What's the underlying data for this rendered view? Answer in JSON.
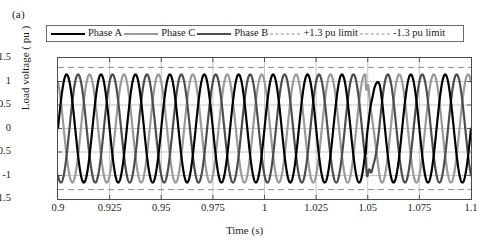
{
  "figure": {
    "panel_label": "(a)"
  },
  "legend": {
    "position": "top",
    "items": [
      {
        "label": "Phase A",
        "style": "solid",
        "color": "#000000",
        "width": 2.2,
        "swatch": "line-swatch-solid"
      },
      {
        "label": "Phase C",
        "style": "solid",
        "color": "#9a9a9a",
        "width": 2.2,
        "swatch": "line-swatch-solid"
      },
      {
        "label": "Phase B",
        "style": "solid",
        "color": "#4d4d4d",
        "width": 2.2,
        "swatch": "line-swatch-solid"
      },
      {
        "label": "+1.3 pu limit",
        "style": "dashed",
        "color": "#8e8e8e",
        "width": 1,
        "swatch": "line-swatch-dashed"
      },
      {
        "label": "-1.3 pu limit",
        "style": "dashed",
        "color": "#8e8e8e",
        "width": 1,
        "swatch": "line-swatch-dashed"
      }
    ]
  },
  "axes": {
    "ylabel": "Load voltage ( pu )",
    "xlabel": "Time (s)",
    "yticks": [
      "1.5",
      "1",
      "0.5",
      "0",
      "-0.5",
      "-1",
      "-1.5"
    ],
    "ytick_values": [
      1.5,
      1.0,
      0.5,
      0.0,
      -0.5,
      -1.0,
      -1.5
    ],
    "xticks": [
      "0.9",
      "0.925",
      "0.95",
      "0.975",
      "1",
      "1.025",
      "1.05",
      "1.075",
      "1.1"
    ],
    "xtick_values": [
      0.9,
      0.925,
      0.95,
      0.975,
      1.0,
      1.025,
      1.05,
      1.075,
      1.1
    ]
  },
  "chart_data": {
    "type": "line",
    "title": "",
    "subtitle": "",
    "xlabel": "Time (s)",
    "ylabel": "Load voltage ( pu )",
    "xlim": [
      0.9,
      1.1
    ],
    "ylim": [
      -1.5,
      1.5
    ],
    "xticks": [
      0.9,
      0.925,
      0.95,
      0.975,
      1.0,
      1.025,
      1.05,
      1.075,
      1.1
    ],
    "yticks": [
      -1.5,
      -1.0,
      -0.5,
      0.0,
      0.5,
      1.0,
      1.5
    ],
    "grid": true,
    "legend_position": "top-outside",
    "annotations": [
      {
        "text": "+1.3 pu limit",
        "type": "hline",
        "y": 1.3,
        "style": "dashed",
        "color": "#8e8e8e"
      },
      {
        "text": "-1.3 pu limit",
        "type": "hline",
        "y": -1.3,
        "style": "dashed",
        "color": "#8e8e8e"
      },
      {
        "text": "transient disturbance",
        "type": "event",
        "x": 1.052
      }
    ],
    "waveform": {
      "frequency_hz": 60,
      "nominal_amplitude_pu": 1.15,
      "phase_offsets_deg": [
        0,
        -120,
        120
      ],
      "disturbance": {
        "start_s": 1.049,
        "end_s": 1.056,
        "description": "brief voltage notch/spike transient on all phases"
      }
    },
    "series": [
      {
        "name": "Phase A",
        "color": "#000000",
        "style": "solid",
        "width": 2.2,
        "amplitude_pu": 1.15,
        "phase_deg": 0
      },
      {
        "name": "Phase C",
        "color": "#9a9a9a",
        "style": "solid",
        "width": 2.2,
        "amplitude_pu": 1.15,
        "phase_deg": 120
      },
      {
        "name": "Phase B",
        "color": "#4d4d4d",
        "style": "solid",
        "width": 2.2,
        "amplitude_pu": 1.15,
        "phase_deg": -120
      },
      {
        "name": "+1.3 pu limit",
        "color": "#8e8e8e",
        "style": "dashed",
        "width": 1,
        "constant_pu": 1.3
      },
      {
        "name": "-1.3 pu limit",
        "color": "#8e8e8e",
        "style": "dashed",
        "width": 1,
        "constant_pu": -1.3
      }
    ]
  },
  "colors": {
    "axis": "#4a4a4a",
    "grid": "#b8b8b8",
    "limit": "#8e8e8e",
    "background": "#ffffff"
  }
}
